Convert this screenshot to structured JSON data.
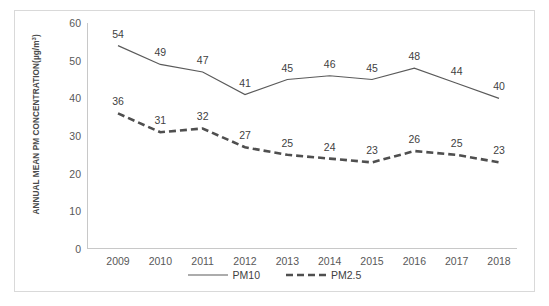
{
  "chart_data": {
    "type": "line",
    "title": "",
    "xlabel": "",
    "ylabel": "ANNUAL MEAN PM CONCENTRATION(µg/m",
    "ylabel_sup": "3",
    "ylabel_close": ")",
    "categories": [
      "2009",
      "2010",
      "2011",
      "2012",
      "2013",
      "2014",
      "2015",
      "2016",
      "2017",
      "2018"
    ],
    "yticks": [
      60,
      50,
      40,
      30,
      20,
      10,
      0
    ],
    "ylim": [
      0,
      60
    ],
    "grid": false,
    "legend_position": "bottom",
    "series": [
      {
        "name": "PM10",
        "style": "solid",
        "color": "#5a5a5a",
        "values": [
          54,
          49,
          47,
          41,
          45,
          46,
          45,
          48,
          44,
          40
        ]
      },
      {
        "name": "PM2.5",
        "style": "dashed",
        "color": "#4f4f4f",
        "values": [
          36,
          31,
          32,
          27,
          25,
          24,
          23,
          26,
          25,
          23
        ]
      }
    ]
  },
  "legend": {
    "items": [
      {
        "label": "PM10"
      },
      {
        "label": "PM2.5"
      }
    ]
  }
}
